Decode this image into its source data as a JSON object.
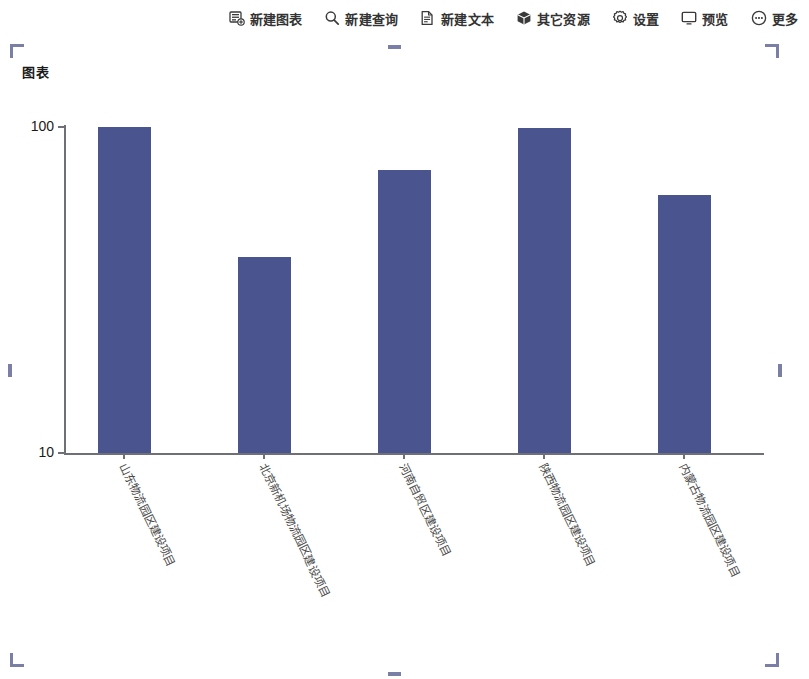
{
  "toolbar": {
    "items": [
      {
        "label": "新建图表",
        "icon": "new-chart-icon"
      },
      {
        "label": "新建查询",
        "icon": "search-icon"
      },
      {
        "label": "新建文本",
        "icon": "document-icon"
      },
      {
        "label": "其它资源",
        "icon": "cube-icon"
      },
      {
        "label": "设置",
        "icon": "gear-icon"
      },
      {
        "label": "预览",
        "icon": "monitor-icon"
      },
      {
        "label": "更多",
        "icon": "ellipsis-circle-icon"
      }
    ]
  },
  "panel": {
    "title": "图表",
    "selected": true,
    "handle_color": "#7b7fa6"
  },
  "chart_data": {
    "type": "bar",
    "title": "图表",
    "xlabel": "",
    "ylabel": "",
    "yscale": "log",
    "ylim": [
      10,
      100
    ],
    "ytick_labels": [
      "100",
      "10"
    ],
    "ytick_values": [
      100,
      10
    ],
    "grid": false,
    "legend": false,
    "bar_color": "#4a5590",
    "categories": [
      "山东物流园区建设项目",
      "北京新机场物流园区建设项目",
      "河南自贸区建设项目",
      "陕西物流园区建设项目",
      "内蒙古物流园区建设项目"
    ],
    "values": [
      100,
      40,
      74,
      99,
      62
    ],
    "series": [
      {
        "name": "项目",
        "values": [
          100,
          40,
          74,
          99,
          62
        ]
      }
    ]
  }
}
